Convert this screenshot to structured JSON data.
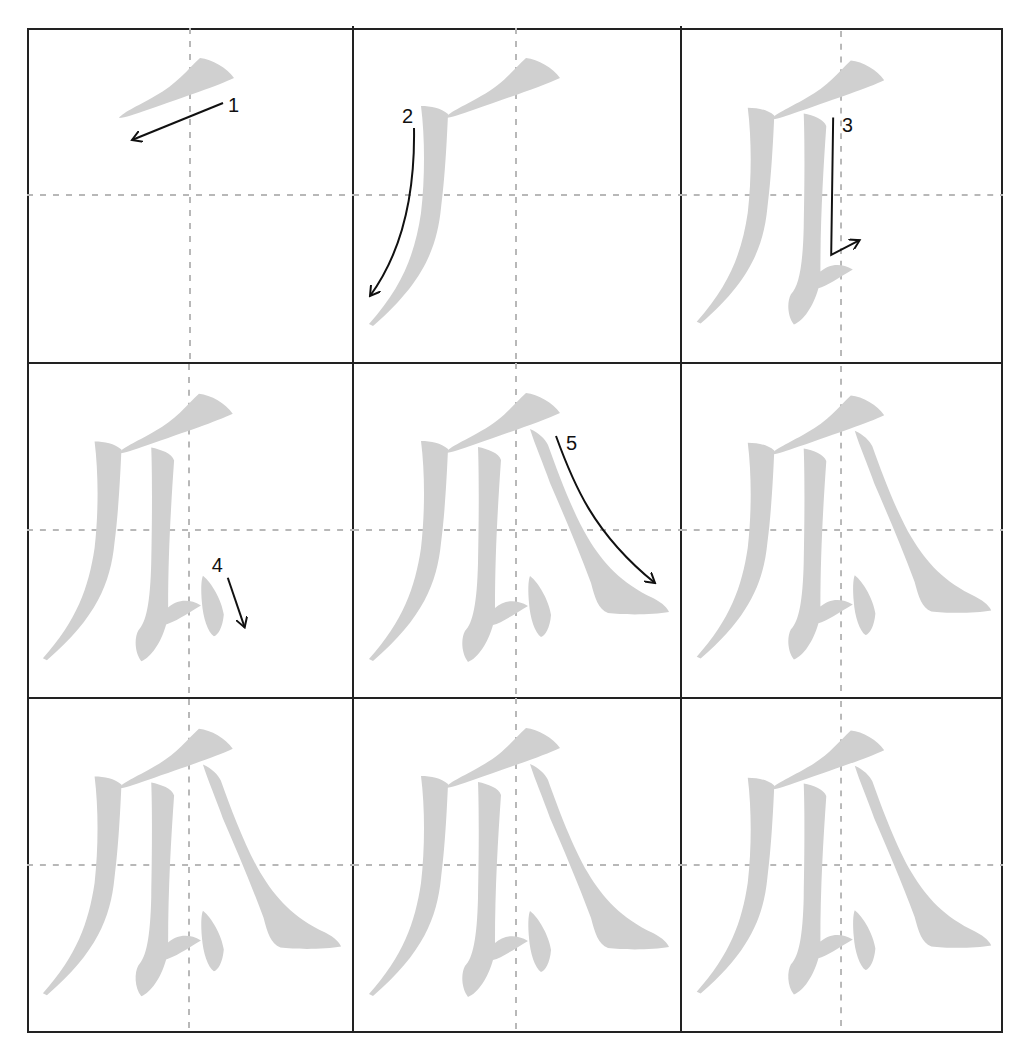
{
  "character": "瓜",
  "grid": {
    "rows": 3,
    "cols": 3
  },
  "colors": {
    "stroke_fill": "#d0d0d0",
    "guide": "#b8b8b8",
    "border": "#222222",
    "arrow": "#111111"
  },
  "cells": [
    {
      "index": 1,
      "strokes_shown": 1,
      "arrow_label": "1"
    },
    {
      "index": 2,
      "strokes_shown": 2,
      "arrow_label": "2"
    },
    {
      "index": 3,
      "strokes_shown": 3,
      "arrow_label": "3"
    },
    {
      "index": 4,
      "strokes_shown": 4,
      "arrow_label": "4"
    },
    {
      "index": 5,
      "strokes_shown": 5,
      "arrow_label": "5"
    },
    {
      "index": 6,
      "strokes_shown": 5,
      "arrow_label": ""
    },
    {
      "index": 7,
      "strokes_shown": 5,
      "arrow_label": ""
    },
    {
      "index": 8,
      "strokes_shown": 5,
      "arrow_label": ""
    },
    {
      "index": 9,
      "strokes_shown": 5,
      "arrow_label": ""
    }
  ]
}
